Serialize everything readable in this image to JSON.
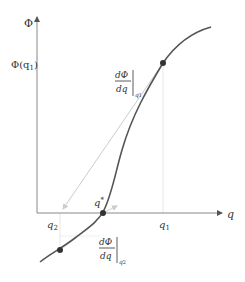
{
  "diagram": {
    "axes": {
      "y_label": "Φ",
      "x_label": "q"
    },
    "labels": {
      "phi_q1": "Φ(q",
      "phi_q1_sub": "1",
      "phi_q1_close": ")",
      "q_star": "q",
      "q_star_sup": "*",
      "q1": "q",
      "q1_sub": "1",
      "q2": "q",
      "q2_sub": "2",
      "deriv_num": "dΦ",
      "deriv_den": "dq",
      "deriv_at_q1_sub": "q",
      "deriv_at_q1_subsub": "1",
      "deriv_at_q2_sub": "q",
      "deriv_at_q2_subsub": "2"
    },
    "colors": {
      "axis": "#888888",
      "curve": "#555555",
      "tangent": "#cccccc",
      "guide": "#e0e0e0",
      "dot": "#333333",
      "text": "#333333"
    },
    "points": [
      {
        "name": "q1_point",
        "x": 163,
        "y": 63
      },
      {
        "name": "q_star_point",
        "x": 103,
        "y": 213
      },
      {
        "name": "q2_point",
        "x": 60,
        "y": 250
      }
    ]
  }
}
